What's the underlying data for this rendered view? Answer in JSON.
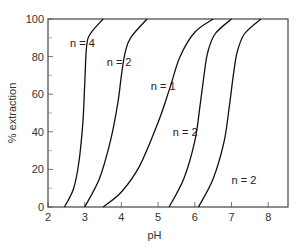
{
  "chart_data": {
    "type": "line",
    "title": "",
    "xlabel": "pH",
    "ylabel": "% extraction",
    "xlim": [
      2,
      8.5
    ],
    "ylim": [
      0,
      100
    ],
    "xticks": [
      2,
      3,
      4,
      5,
      6,
      7,
      8
    ],
    "yticks": [
      0,
      20,
      40,
      60,
      80,
      100
    ],
    "grid": false,
    "legend": "none (inline curve labels)",
    "series": [
      {
        "name": "n = 4",
        "label": "n = 4",
        "x": [
          2.45,
          2.7,
          2.85,
          2.95,
          3.0,
          3.05,
          3.15,
          3.5
        ],
        "y": [
          0,
          10,
          25,
          45,
          65,
          85,
          92,
          100
        ]
      },
      {
        "name": "n = 2 (a)",
        "label": "n = 2",
        "x": [
          3.0,
          3.4,
          3.7,
          3.9,
          4.0,
          4.1,
          4.25,
          4.7
        ],
        "y": [
          0,
          15,
          35,
          55,
          70,
          82,
          90,
          100
        ]
      },
      {
        "name": "n = 1",
        "label": "n = 1",
        "x": [
          3.5,
          4.0,
          4.5,
          5.0,
          5.3,
          5.6,
          6.0,
          6.5
        ],
        "y": [
          0,
          8,
          22,
          45,
          62,
          80,
          93,
          100
        ]
      },
      {
        "name": "n = 2 (b)",
        "label": "n = 2",
        "x": [
          5.3,
          5.7,
          6.0,
          6.15,
          6.25,
          6.35,
          6.55,
          7.0
        ],
        "y": [
          0,
          15,
          35,
          55,
          70,
          82,
          92,
          100
        ]
      },
      {
        "name": "n = 2 (c)",
        "label": "n = 2",
        "x": [
          6.1,
          6.5,
          6.8,
          6.95,
          7.05,
          7.15,
          7.35,
          7.8
        ],
        "y": [
          0,
          15,
          35,
          55,
          70,
          82,
          92,
          100
        ]
      }
    ],
    "annotations": [
      {
        "text": "n = 4",
        "x": 2.6,
        "y": 85
      },
      {
        "text": "n = 2",
        "x": 3.6,
        "y": 75
      },
      {
        "text": "n = 1",
        "x": 4.8,
        "y": 62
      },
      {
        "text": "n = 2",
        "x": 5.4,
        "y": 38
      },
      {
        "text": "n = 2",
        "x": 7.0,
        "y": 12
      }
    ]
  }
}
